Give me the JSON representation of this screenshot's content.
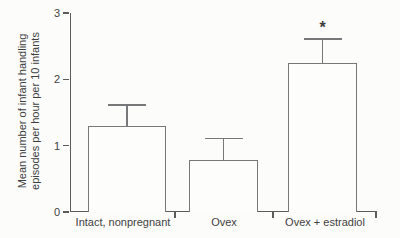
{
  "figure": {
    "background": "#fcfcfb",
    "axis_color": "#5c5c5e",
    "bar_border_color": "#77787a",
    "bar_fill": "#fdfdfc",
    "text_color": "#3f3f41"
  },
  "chart_data": {
    "type": "bar",
    "title": "",
    "xlabel": "",
    "ylabel": "Mean number of infant handling episodes per hour per 10 infants",
    "ylabel_lines": [
      "Mean number of infant handling",
      "episodes per hour per 10 infants"
    ],
    "categories": [
      "Intact, nonpregnant",
      "Ovex",
      "Ovex + estradiol"
    ],
    "values": [
      1.3,
      0.78,
      2.25
    ],
    "error_bar_tops": [
      1.6,
      1.1,
      2.6
    ],
    "ylim": [
      0,
      3
    ],
    "yticks": [
      0,
      1,
      2,
      3
    ],
    "ytick_labels": [
      "0",
      "1",
      "2",
      "3"
    ],
    "grid": false,
    "legend": null,
    "annotations": [
      {
        "text": "*",
        "category": "Ovex + estradiol"
      }
    ]
  }
}
